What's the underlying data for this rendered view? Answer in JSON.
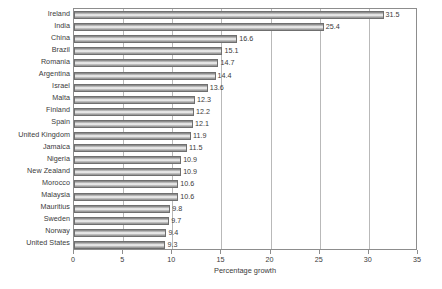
{
  "chart_data": {
    "type": "bar",
    "orientation": "horizontal",
    "title": "",
    "xlabel": "Percentage growth",
    "ylabel": "",
    "xlim": [
      0,
      35
    ],
    "xticks": [
      0,
      5,
      10,
      15,
      20,
      25,
      30,
      35
    ],
    "grid": "vertical",
    "legend": "none",
    "categories": [
      "Ireland",
      "India",
      "China",
      "Brazil",
      "Romania",
      "Argentina",
      "Israel",
      "Malta",
      "Finland",
      "Spain",
      "United Kingdom",
      "Jamaica",
      "Nigeria",
      "New Zealand",
      "Morocco",
      "Malaysia",
      "Mauritius",
      "Sweden",
      "Norway",
      "United States"
    ],
    "values": [
      31.5,
      25.4,
      16.6,
      15.1,
      14.7,
      14.4,
      13.6,
      12.3,
      12.2,
      12.1,
      11.9,
      11.5,
      10.9,
      10.9,
      10.6,
      10.6,
      9.8,
      9.7,
      9.4,
      9.3
    ],
    "value_labels": [
      "31.5",
      "25.4",
      "16.6",
      "15.1",
      "14.7",
      "14.4",
      "13.6",
      "12.3",
      "12.2",
      "12.1",
      "11.9",
      "11.5",
      "10.9",
      "10.9",
      "10.6",
      "10.6",
      "9.8",
      "9.7",
      "9.4",
      "9.3"
    ],
    "colors": {
      "bar_fill_light": "#f2f2f2",
      "bar_fill_dark": "#8e8e8e",
      "bar_border": "#6f6f6f",
      "gridline": "#b9b9b9",
      "axis": "#8d8d8d",
      "text": "#3a3a3a",
      "background": "#ffffff"
    }
  }
}
